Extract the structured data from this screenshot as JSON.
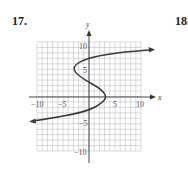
{
  "problems": [
    {
      "number": "17."
    },
    {
      "number": "18."
    }
  ],
  "graph": {
    "x_axis_label": "x",
    "y_axis_label": "y",
    "x_tick_labels": [
      "−10",
      "−5",
      "5",
      "10"
    ],
    "y_tick_labels": [
      "10",
      "5",
      "−5",
      "−10"
    ],
    "grid": {
      "xmin": -10,
      "xmax": 10,
      "ymin": -10,
      "ymax": 10,
      "step": 1
    },
    "curve_color": "#3a3a3a",
    "grid_color": "#b5b5b5",
    "axis_color": "#333333"
  },
  "chart_data": {
    "type": "line",
    "title": "",
    "xlabel": "x",
    "ylabel": "y",
    "xlim": [
      -10,
      10
    ],
    "ylim": [
      -10,
      10
    ],
    "grid": true,
    "series": [
      {
        "name": "curve",
        "x": [
          -11.3,
          -5,
          0,
          2.5,
          3.2,
          2,
          0,
          -2.5,
          -3,
          -2,
          0,
          5,
          12.5
        ],
        "y": [
          -4.5,
          -3.7,
          -2.7,
          -1.2,
          0,
          1.5,
          2.5,
          4,
          5,
          6.2,
          6.9,
          8,
          8.8
        ]
      }
    ]
  }
}
